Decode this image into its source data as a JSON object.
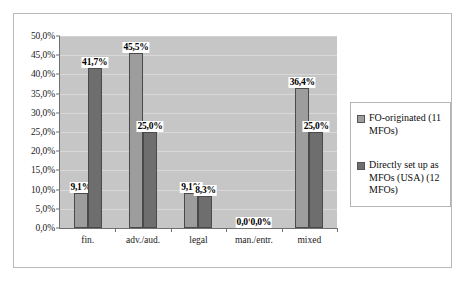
{
  "chart_data": {
    "type": "bar",
    "title": "",
    "subtitle": "",
    "xlabel": "",
    "ylabel": "",
    "categories": [
      "fin.",
      "adv./aud.",
      "legal",
      "man./entr.",
      "mixed"
    ],
    "series": [
      {
        "name": "FO-originated (11 MFOs)",
        "color": "#9d9d9d",
        "values": [
          9.1,
          45.5,
          9.1,
          0.0,
          36.4
        ],
        "labels": [
          "9,1%",
          "45,5%",
          "9,1%",
          "0,0%",
          "36,4%"
        ]
      },
      {
        "name": "Directly set up as MFOs (USA) (12 MFOs)",
        "color": "#6e6e6e",
        "values": [
          41.7,
          25.0,
          8.3,
          0.0,
          25.0
        ],
        "labels": [
          "41,7%",
          "25,0%",
          "8,3%",
          "0,0%",
          "25,0%"
        ]
      }
    ],
    "ylim": [
      0,
      50
    ],
    "ytick_values": [
      0,
      5,
      10,
      15,
      20,
      25,
      30,
      35,
      40,
      45,
      50
    ],
    "ytick_labels": [
      "0,0%",
      "5,0%",
      "10,0%",
      "15,0%",
      "20,0%",
      "25,0%",
      "30,0%",
      "35,0%",
      "40,0%",
      "45,0%",
      "50,0%"
    ],
    "grid": true,
    "legend_position": "right",
    "plot_background": "#c6c6c6",
    "gridline_color": "#d8d8d8",
    "axis_color": "#70706f",
    "frame_border": "#b9b9b9",
    "legend_entries": [
      "FO-originated (11 MFOs)",
      "Directly set up as MFOs (USA) (12 MFOs)"
    ]
  }
}
